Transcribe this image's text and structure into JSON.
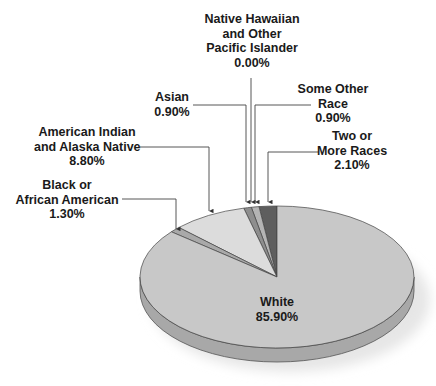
{
  "chart_data": {
    "type": "pie",
    "style": "3d",
    "title": "",
    "categories": [
      "White",
      "Black or African American",
      "American Indian and Alaska Native",
      "Asian",
      "Native Hawaiian and Other Pacific Islander",
      "Some Other Race",
      "Two or More Races"
    ],
    "values": [
      85.9,
      1.3,
      8.8,
      0.9,
      0.0,
      0.9,
      2.1
    ],
    "value_labels": [
      "85.90%",
      "1.30%",
      "8.80%",
      "0.90%",
      "0.00%",
      "0.90%",
      "2.10%"
    ],
    "colors": [
      "#c8c8c8",
      "#a9a9a9",
      "#dcdcdc",
      "#8e8e8e",
      "#a0a0a0",
      "#b4b4b4",
      "#5e5e5e"
    ],
    "legend": "none (callout labels with leader arrows)"
  },
  "labels": {
    "white": {
      "lines": [
        "White"
      ],
      "value": "85.90%"
    },
    "black": {
      "lines": [
        "Black or",
        "African American"
      ],
      "value": "1.30%"
    },
    "aian": {
      "lines": [
        "American Indian",
        "and Alaska Native"
      ],
      "value": "8.80%"
    },
    "asian": {
      "lines": [
        "Asian"
      ],
      "value": "0.90%"
    },
    "nhpi": {
      "lines": [
        "Native Hawaiian",
        "and Other",
        "Pacific Islander"
      ],
      "value": "0.00%"
    },
    "other": {
      "lines": [
        "Some Other",
        "Race"
      ],
      "value": "0.90%"
    },
    "two": {
      "lines": [
        "Two or",
        "More Races"
      ],
      "value": "2.10%"
    }
  }
}
